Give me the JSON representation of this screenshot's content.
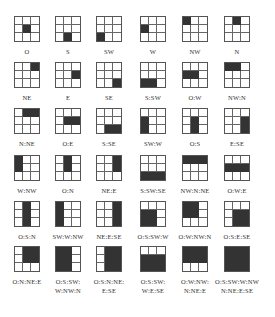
{
  "figure": {
    "cell_order": [
      "NW",
      "N",
      "NE",
      "W",
      "O",
      "E",
      "SW",
      "S",
      "SE"
    ],
    "fill_color": "#333333",
    "line_color": "#555555",
    "patterns": [
      {
        "label": "O",
        "filled": [
          4
        ]
      },
      {
        "label": "S",
        "filled": [
          7
        ]
      },
      {
        "label": "SW",
        "filled": [
          6
        ]
      },
      {
        "label": "W",
        "filled": [
          3
        ]
      },
      {
        "label": "NW",
        "filled": [
          0
        ]
      },
      {
        "label": "N",
        "filled": [
          1
        ]
      },
      {
        "label": "NE",
        "filled": [
          2
        ]
      },
      {
        "label": "E",
        "filled": [
          5
        ]
      },
      {
        "label": "SE",
        "filled": [
          8
        ]
      },
      {
        "label": "S:SW",
        "filled": [
          6,
          7
        ]
      },
      {
        "label": "O:W",
        "filled": [
          3,
          4
        ]
      },
      {
        "label": "NW:N",
        "filled": [
          0,
          1
        ]
      },
      {
        "label": "N:NE",
        "filled": [
          1,
          2
        ]
      },
      {
        "label": "O:E",
        "filled": [
          4,
          5
        ]
      },
      {
        "label": "S:SE",
        "filled": [
          7,
          8
        ]
      },
      {
        "label": "SW:W",
        "filled": [
          3,
          6
        ]
      },
      {
        "label": "O:S",
        "filled": [
          4,
          7
        ]
      },
      {
        "label": "E:SE",
        "filled": [
          5,
          8
        ]
      },
      {
        "label": "W:NW",
        "filled": [
          0,
          3
        ]
      },
      {
        "label": "O:N",
        "filled": [
          1,
          4
        ]
      },
      {
        "label": "NE:E",
        "filled": [
          2,
          5
        ]
      },
      {
        "label": "S:SW:SE",
        "filled": [
          6,
          7,
          8
        ]
      },
      {
        "label": "NW:N:NE",
        "filled": [
          0,
          1,
          2
        ]
      },
      {
        "label": "O:W:E",
        "filled": [
          3,
          4,
          5
        ]
      },
      {
        "label": "O:S:N",
        "filled": [
          1,
          4,
          7
        ]
      },
      {
        "label": "SW:W:NW",
        "filled": [
          0,
          3,
          6
        ]
      },
      {
        "label": "NE:E:SE",
        "filled": [
          2,
          5,
          8
        ]
      },
      {
        "label": "O:S:SW:W",
        "filled": [
          3,
          4,
          6,
          7
        ]
      },
      {
        "label": "O:W:NW:N",
        "filled": [
          0,
          1,
          3,
          4
        ]
      },
      {
        "label": "O:S:E:SE",
        "filled": [
          4,
          5,
          7,
          8
        ]
      },
      {
        "label": "O:N:NE:E",
        "filled": [
          1,
          2,
          4,
          5
        ]
      },
      {
        "label": "O:S:SW:\nW:NW:N",
        "filled": [
          0,
          1,
          3,
          4,
          6,
          7
        ]
      },
      {
        "label": "O:S:N:NE:\nE:SE",
        "filled": [
          1,
          2,
          4,
          5,
          7,
          8
        ]
      },
      {
        "label": "O:S:SW:\nW:E:SE",
        "filled": [
          3,
          4,
          5,
          6,
          7,
          8
        ]
      },
      {
        "label": "O:W:NW:\nN:NE:E",
        "filled": [
          0,
          1,
          2,
          3,
          4,
          5
        ]
      },
      {
        "label": "O:S:SW:W:NW\nN:NE:E:SE",
        "filled": [
          0,
          1,
          2,
          3,
          4,
          5,
          6,
          7,
          8
        ]
      }
    ]
  }
}
